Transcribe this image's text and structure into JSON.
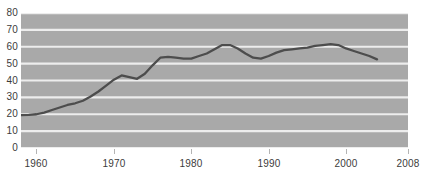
{
  "top_partial_text": ". .",
  "colors": {
    "page_background": "#ffffff",
    "plot_background": "#a9a9a9",
    "gridline": "#ededed",
    "line": "#4d4d4d",
    "tick_text": "#3c3c3c",
    "tick_mark": "#b4b4b4"
  },
  "axes": {
    "y_ticks": [
      "80",
      "70",
      "60",
      "50",
      "40",
      "30",
      "20",
      "10",
      "0"
    ],
    "x_ticks": [
      "1960",
      "1970",
      "1980",
      "1990",
      "2000",
      "2008"
    ]
  },
  "chart_data": {
    "type": "line",
    "title": "",
    "subtitle": "",
    "xlabel": "",
    "ylabel": "",
    "xlim": [
      1958,
      2008
    ],
    "ylim": [
      0,
      80
    ],
    "grid": true,
    "legend": null,
    "x_tick_values": [
      1960,
      1970,
      1980,
      1990,
      2000,
      2008
    ],
    "y_tick_values": [
      0,
      10,
      20,
      30,
      40,
      50,
      60,
      70,
      80
    ],
    "series": [
      {
        "name": "series-1",
        "color": "#4d4d4d",
        "x": [
          1958,
          1959,
          1960,
          1961,
          1962,
          1963,
          1964,
          1965,
          1966,
          1967,
          1968,
          1969,
          1970,
          1971,
          1972,
          1973,
          1974,
          1975,
          1976,
          1977,
          1978,
          1979,
          1980,
          1981,
          1982,
          1983,
          1984,
          1985,
          1986,
          1987,
          1988,
          1989,
          1990,
          1991,
          1992,
          1993,
          1994,
          1995,
          1996,
          1997,
          1998,
          1999,
          2000,
          2001,
          2002,
          2003,
          2004
        ],
        "y": [
          19.5,
          19.6,
          20.0,
          21.0,
          22.5,
          24.0,
          25.5,
          26.5,
          28.0,
          30.5,
          33.5,
          37.0,
          40.5,
          43.0,
          42.0,
          41.0,
          44.0,
          49.0,
          53.5,
          54.0,
          53.5,
          53.0,
          53.0,
          54.5,
          56.0,
          58.5,
          61.0,
          61.0,
          59.0,
          56.0,
          53.5,
          53.0,
          54.5,
          56.5,
          58.0,
          58.5,
          59.0,
          59.5,
          60.5,
          61.0,
          61.5,
          61.0,
          59.0,
          57.5,
          56.0,
          54.5,
          52.5
        ]
      }
    ]
  }
}
